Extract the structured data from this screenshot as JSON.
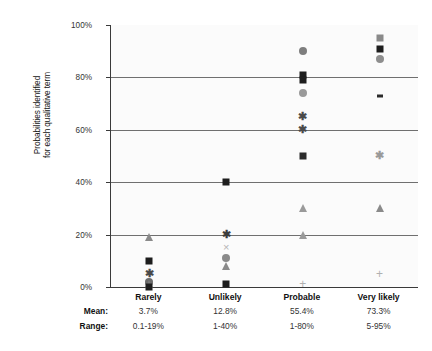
{
  "chart_data": {
    "type": "scatter",
    "title": "",
    "xlabel": "",
    "ylabel": "Probabilities identified for each qualitative term",
    "ylabel_lines": [
      "Probabilities identified",
      "for each qualitative term"
    ],
    "ylim": [
      0,
      100
    ],
    "yticks": [
      0,
      20,
      40,
      60,
      80,
      100
    ],
    "ytick_labels": [
      "0%",
      "20%",
      "40%",
      "60%",
      "80%",
      "100%"
    ],
    "gridlines_at": [
      20,
      40,
      60,
      80
    ],
    "grid": true,
    "legend": "none",
    "categories": [
      "Rarely",
      "Unlikely",
      "Probable",
      "Very likely"
    ],
    "series": [
      {
        "name": "Rarely",
        "points": [
          {
            "value": 19,
            "marker": "triangle",
            "color": "#8a8a8a"
          },
          {
            "value": 10,
            "marker": "square",
            "color": "#1d1d1d"
          },
          {
            "value": 5,
            "marker": "asterisk",
            "color": "#4a4a4a"
          },
          {
            "value": 2,
            "marker": "circle",
            "color": "#6a6a6a"
          },
          {
            "value": 1,
            "marker": "triangle",
            "color": "#7a7a7a"
          },
          {
            "value": 0.1,
            "marker": "square",
            "color": "#1d1d1d"
          }
        ]
      },
      {
        "name": "Unlikely",
        "points": [
          {
            "value": 40,
            "marker": "square",
            "color": "#1d1d1d"
          },
          {
            "value": 20,
            "marker": "asterisk",
            "color": "#3d3d3d"
          },
          {
            "value": 15,
            "marker": "cross-x",
            "color": "#b5b5b5"
          },
          {
            "value": 11,
            "marker": "circle",
            "color": "#8a8a8a"
          },
          {
            "value": 8,
            "marker": "triangle",
            "color": "#8a8a8a"
          },
          {
            "value": 1,
            "marker": "square",
            "color": "#1d1d1d"
          }
        ]
      },
      {
        "name": "Probable",
        "points": [
          {
            "value": 90,
            "marker": "circle",
            "color": "#7e7e7e"
          },
          {
            "value": 81,
            "marker": "square",
            "color": "#1d1d1d"
          },
          {
            "value": 79,
            "marker": "square",
            "color": "#1d1d1d"
          },
          {
            "value": 74,
            "marker": "circle",
            "color": "#9a9a9a"
          },
          {
            "value": 65,
            "marker": "asterisk",
            "color": "#4a4a4a"
          },
          {
            "value": 60,
            "marker": "asterisk",
            "color": "#4a4a4a"
          },
          {
            "value": 50,
            "marker": "square",
            "color": "#2a2a2a"
          },
          {
            "value": 30,
            "marker": "triangle",
            "color": "#9a9a9a"
          },
          {
            "value": 20,
            "marker": "triangle",
            "color": "#9a9a9a"
          },
          {
            "value": 1,
            "marker": "plus",
            "color": "#b0b0b0"
          }
        ]
      },
      {
        "name": "Very likely",
        "points": [
          {
            "value": 95,
            "marker": "square",
            "color": "#8a8a8a"
          },
          {
            "value": 91,
            "marker": "square",
            "color": "#1d1d1d"
          },
          {
            "value": 87,
            "marker": "circle",
            "color": "#8e8e8e"
          },
          {
            "value": 73,
            "marker": "dash",
            "color": "#2a2a2a"
          },
          {
            "value": 50,
            "marker": "asterisk",
            "color": "#9a9a9a"
          },
          {
            "value": 30,
            "marker": "triangle",
            "color": "#8a8a8a"
          },
          {
            "value": 5,
            "marker": "plus",
            "color": "#b0b0b0"
          }
        ]
      }
    ],
    "stats_table": {
      "rows": [
        {
          "label": "Mean:",
          "values": [
            "3.7%",
            "12.8%",
            "55.4%",
            "73.3%"
          ]
        },
        {
          "label": "Range:",
          "values": [
            "0.1-19%",
            "1-40%",
            "1-80%",
            "5-95%"
          ]
        }
      ]
    }
  },
  "colors": {
    "axis": "#3a3a3a",
    "gridline": "#6f6f6f",
    "plot_background": "#fbfbfb",
    "page_background": "#ffffff",
    "text": "#1a1a1a"
  }
}
